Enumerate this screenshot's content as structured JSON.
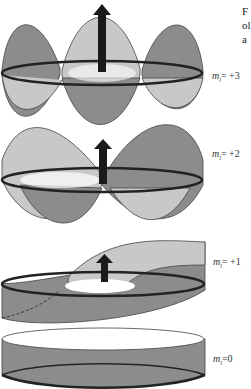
{
  "figure": {
    "caption_fragment": [
      "F",
      "ol",
      "a"
    ],
    "panels": [
      {
        "label_m": "m",
        "label_sub": "l",
        "label_value": "= +3",
        "arrow": "up"
      },
      {
        "label_m": "m",
        "label_sub": "l",
        "label_value": "= +2",
        "arrow": "up"
      },
      {
        "label_m": "m",
        "label_sub": "l",
        "label_value": "= +1",
        "arrow": "up"
      },
      {
        "label_m": "m",
        "label_sub": "l",
        "label_value": "=0",
        "arrow": "none"
      }
    ],
    "colors": {
      "dark_lobe": "#8c8c8c",
      "light_lobe": "#c8c8c8",
      "ring": "#222222",
      "arrow": "#1a1a1a",
      "outline": "#444444"
    }
  }
}
